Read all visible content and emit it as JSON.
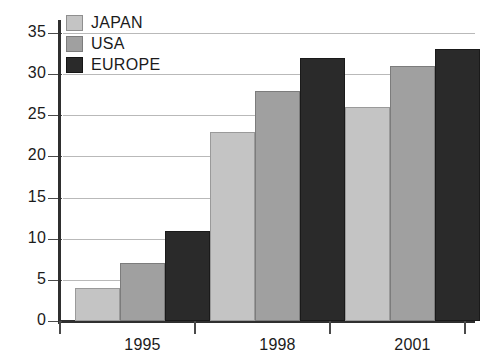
{
  "chart_data": {
    "type": "bar",
    "title": "",
    "subtitle": "",
    "xlabel": "",
    "ylabel": "",
    "categories": [
      "1995",
      "1998",
      "2001"
    ],
    "series": [
      {
        "name": "JAPAN",
        "values": [
          4,
          23,
          26
        ],
        "color": "#c4c4c4"
      },
      {
        "name": "USA",
        "values": [
          7,
          28,
          31
        ],
        "color": "#a0a0a0"
      },
      {
        "name": "EUROPE",
        "values": [
          11,
          32,
          33
        ],
        "color": "#2a2a2a"
      }
    ],
    "ylim": [
      0,
      35
    ],
    "ytick_labels": [
      "0",
      "5",
      "10",
      "15",
      "20",
      "25",
      "30",
      "35"
    ],
    "ytick_values": [
      0,
      5,
      10,
      15,
      20,
      25,
      30,
      35
    ],
    "grid": true,
    "grid_axis": "y",
    "legend_position": "top-left",
    "bar_orientation": "vertical",
    "grouped": true
  },
  "legend": {
    "entries": [
      {
        "label": "JAPAN",
        "swatch": "legend-swatch-japan"
      },
      {
        "label": "USA",
        "swatch": "legend-swatch-usa"
      },
      {
        "label": "EUROPE",
        "swatch": "legend-swatch-europe"
      }
    ]
  },
  "axes": {
    "y_ticks": [
      "35",
      "30",
      "25",
      "20",
      "15",
      "10",
      "5",
      "0"
    ],
    "x_ticks": [
      "1995",
      "1998",
      "2001"
    ]
  },
  "colors": {
    "japan": "#c4c4c4",
    "usa": "#a0a0a0",
    "europe": "#2a2a2a",
    "axis": "#2f2f2f",
    "gridline": "#b9b9b9",
    "text": "#1b1b1b",
    "background": "#ffffff"
  }
}
